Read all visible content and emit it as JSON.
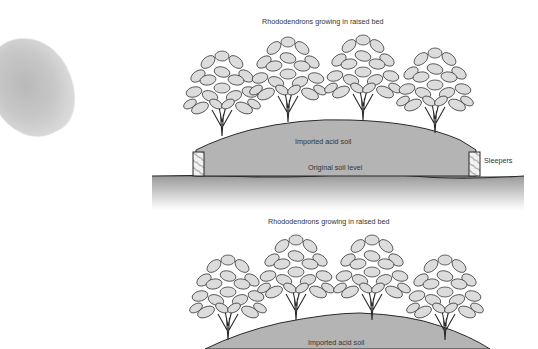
{
  "figure_top": {
    "title": "Rhododendrons growing in raised bed",
    "labels": {
      "soil": "Imported acid soil",
      "original_level": "Original soil level",
      "sleepers": "Sleepers"
    },
    "plants": 4
  },
  "figure_bottom": {
    "title": "Rhododendrons growing in raised bed",
    "labels": {
      "soil": "Imported acid soil"
    },
    "plants": 4
  },
  "colors": {
    "soil": "#b4b4b4",
    "ground_top": "#9a9a9a",
    "ground_bottom": "#ffffff",
    "outline": "#2a2a2a",
    "leaf": "#d9d9d9",
    "blob": "#c0c0c0"
  }
}
